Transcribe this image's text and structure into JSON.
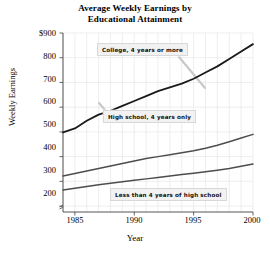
{
  "chart_data": {
    "type": "line",
    "title": "Average Weekly Earnings by Educational Attainment",
    "title_line1": "Average Weekly Earnings by",
    "title_line2": "Educational Attainment",
    "xlabel": "Year",
    "ylabel": "Weekly Earnings",
    "xlim": [
      1984,
      2000
    ],
    "ylim": [
      176,
      900
    ],
    "grid": true,
    "legend_position": "inline-callouts",
    "y_ticks": [
      900,
      800,
      700,
      600,
      500,
      400,
      300,
      200
    ],
    "y_tick_labels": [
      "$900",
      "800",
      "700",
      "600",
      "500",
      "400",
      "300",
      "200"
    ],
    "x_ticks": [
      1985,
      1990,
      1995,
      2000
    ],
    "x_tick_labels": [
      "1985",
      "1990",
      "1995",
      "2000"
    ],
    "x_minor_interval": 1,
    "axis_break": true,
    "x": [
      1984,
      1985,
      1986,
      1987,
      1988,
      1989,
      1990,
      1991,
      1992,
      1993,
      1994,
      1995,
      1996,
      1997,
      1998,
      1999,
      2000
    ],
    "series": [
      {
        "name": "College, 4 years or more",
        "color": "#1a1a1a",
        "width": 1.8,
        "values": [
          498,
          514,
          545,
          570,
          585,
          605,
          625,
          645,
          665,
          680,
          695,
          715,
          740,
          765,
          795,
          825,
          855
        ]
      },
      {
        "name": "High school, 4 years only",
        "color": "#4d4d4d",
        "width": 1.5,
        "values": [
          322,
          332,
          342,
          352,
          362,
          372,
          382,
          392,
          400,
          408,
          416,
          424,
          434,
          446,
          460,
          475,
          490
        ]
      },
      {
        "name": "Less than 4 years of high school",
        "color": "#4d4d4d",
        "width": 1.5,
        "values": [
          265,
          272,
          279,
          286,
          292,
          298,
          304,
          310,
          316,
          322,
          328,
          333,
          339,
          345,
          352,
          361,
          370
        ]
      }
    ],
    "annotations": [
      {
        "id": "college",
        "label": "College, 4 years or more"
      },
      {
        "id": "highschool",
        "label": "High school, 4 years only"
      },
      {
        "id": "lessthan",
        "label": "Less than 4 years of high school"
      }
    ],
    "colors": {
      "grid": "#e2e2e2",
      "axis": "#555555",
      "leader": "#c9c9c9",
      "callout_bg": "#f2f2f2"
    }
  }
}
